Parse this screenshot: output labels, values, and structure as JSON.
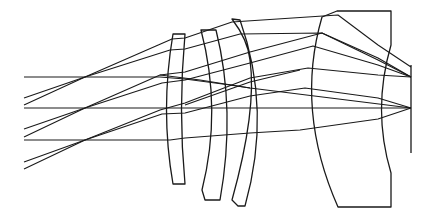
{
  "diagram": {
    "title": "",
    "colors": {
      "background": "#ffffff",
      "line": "#1a1a1a"
    },
    "lenses": [
      {
        "name": "lens-1",
        "path": "M173,34 L185,34 Q178,110 185,184 L173,184 Q160,110 173,34 Z"
      },
      {
        "name": "lens-2",
        "path": "M201,30 L216,30 Q236,110 220,200 L205,200 L202,190 Q222,110 201,30 Z"
      },
      {
        "name": "lens-3",
        "path": "M232,19 Q248,40 250,60 Q257,110 232,200 L238,206 L245,206 Q272,110 240,20 Z"
      },
      {
        "name": "rear-element",
        "path": "M337,11 L391,11 L391,45 Q372,110 391,173 L391,207 L338,207 Q295,110 322,17 L337,11 Z"
      }
    ],
    "image_plane": {
      "x": 411,
      "y1": 65,
      "y2": 153
    },
    "rays": [
      {
        "name": "ray-axial-top",
        "points": "24,77 160,77 185,79 230,85 250,88 411,108"
      },
      {
        "name": "ray-axial-mid",
        "points": "24,108 165,108 185,108 250,108 300,108 378,108 411,108"
      },
      {
        "name": "ray-axial-bottom",
        "points": "24,140 170,140 185,138 250,133 300,130 378,119 411,108"
      },
      {
        "name": "ray-oblique-1a",
        "points": "24,98 85,77 172,39 185,38 232,22 338,15 378,45 411,67"
      },
      {
        "name": "ray-oblique-1b",
        "points": "24,105 85,77 170,50 185,49 240,34 322,33 378,58 411,77"
      },
      {
        "name": "ray-oblique-2a",
        "points": "24,129 85,108 160,75 185,72 250,52 322,33 378,60 411,77"
      },
      {
        "name": "ray-oblique-2b",
        "points": "24,137 85,108 162,83 185,80 250,63 313,46 378,65 411,77"
      },
      {
        "name": "ray-oblique-3a",
        "points": "24,162 85,140 160,110 185,103 250,78 308,68 378,75 411,77"
      },
      {
        "name": "ray-oblique-3b",
        "points": "24,169 85,140 162,114 185,113 250,96 305,88 378,98 411,108"
      },
      {
        "name": "ray-cross-1",
        "points": "160,75 200,80 250,88"
      },
      {
        "name": "ray-cross-2",
        "points": "185,105 250,82 300,70"
      }
    ]
  }
}
